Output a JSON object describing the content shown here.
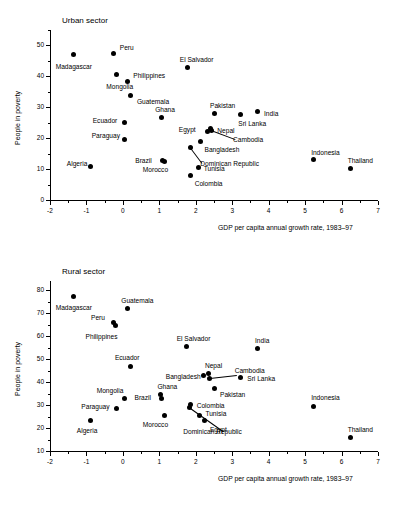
{
  "figure": {
    "shared_xlabel": "GDP per capita annual growth rate, 1983–97",
    "shared_ylabel": "People in poverty"
  },
  "chart_data": [
    {
      "type": "scatter",
      "title": "Urban sector",
      "xlabel": "GDP per capita annual growth rate, 1983–97",
      "ylabel": "People in poverty",
      "xlim": [
        -2,
        7
      ],
      "ylim": [
        0,
        55
      ],
      "xticks": [
        -2,
        -1,
        0,
        1,
        2,
        3,
        4,
        5,
        6,
        7
      ],
      "xticklabels": [
        "-2",
        "-1",
        "0",
        "1",
        "2",
        "3",
        "4",
        "5",
        "6",
        "7"
      ],
      "yticks": [
        0,
        10,
        20,
        30,
        40,
        50
      ],
      "yticklabels": [
        "0",
        "10",
        "20",
        "30",
        "40",
        "50"
      ],
      "minor_xtick_step": 0.5,
      "minor_ytick_step": 5,
      "grid": false,
      "legend": "none",
      "points": [
        {
          "name": "Madagascar",
          "x": -1.35,
          "y": 47.0,
          "label_dx": -18,
          "label_dy": 12,
          "leader": false
        },
        {
          "name": "Algeria",
          "x": -0.88,
          "y": 11.0,
          "label_dx": -24,
          "label_dy": -2,
          "leader": false
        },
        {
          "name": "Peru",
          "x": -0.25,
          "y": 47.5,
          "label_dx": 6,
          "label_dy": -5,
          "leader": false
        },
        {
          "name": "Mongolia",
          "x": -0.18,
          "y": 40.5,
          "label_dx": -10,
          "label_dy": 12,
          "leader": false
        },
        {
          "name": "Philippines",
          "x": 0.12,
          "y": 38.5,
          "label_dx": 6,
          "label_dy": -5,
          "leader": false
        },
        {
          "name": "Ecuador",
          "x": 0.05,
          "y": 25.0,
          "label_dx": -32,
          "label_dy": -2,
          "leader": false
        },
        {
          "name": "Paraguay",
          "x": 0.05,
          "y": 19.6,
          "label_dx": -33,
          "label_dy": -3,
          "leader": false
        },
        {
          "name": "Guatemala",
          "x": 0.22,
          "y": 33.8,
          "label_dx": 6,
          "label_dy": 6,
          "leader": false
        },
        {
          "name": "Ghana",
          "x": 1.05,
          "y": 26.7,
          "label_dx": -6,
          "label_dy": -7,
          "leader": false
        },
        {
          "name": "Brazil",
          "x": 1.08,
          "y": 12.8,
          "label_dx": -27,
          "label_dy": 1,
          "leader": false
        },
        {
          "name": "Morocco",
          "x": 1.15,
          "y": 12.5,
          "label_dx": -22,
          "label_dy": 9,
          "leader": false
        },
        {
          "name": "El Salvador",
          "x": 1.78,
          "y": 43.0,
          "label_dx": -8,
          "label_dy": -7,
          "leader": false
        },
        {
          "name": "Dominican Republic",
          "x": 1.85,
          "y": 17.0,
          "label_dx": 10,
          "label_dy": 17,
          "leader": true
        },
        {
          "name": "Colombia",
          "x": 1.86,
          "y": 8.0,
          "label_dx": 4,
          "label_dy": 9,
          "leader": false
        },
        {
          "name": "Tunisia",
          "x": 2.08,
          "y": 10.6,
          "label_dx": 5,
          "label_dy": 2,
          "leader": false
        },
        {
          "name": "Bangladesh",
          "x": 2.13,
          "y": 18.9,
          "label_dx": 4,
          "label_dy": 8,
          "leader": false
        },
        {
          "name": "Egypt",
          "x": 2.33,
          "y": 22.3,
          "label_dx": -29,
          "label_dy": -1,
          "leader": false
        },
        {
          "name": "Nepal",
          "x": 2.4,
          "y": 23.0,
          "label_dx": 7,
          "label_dy": 2,
          "leader": false
        },
        {
          "name": "Cambodia",
          "x": 2.42,
          "y": 22.6,
          "label_dx": 22,
          "label_dy": 10,
          "leader": true
        },
        {
          "name": "Pakistan",
          "x": 2.5,
          "y": 28.0,
          "label_dx": -4,
          "label_dy": -7,
          "leader": false
        },
        {
          "name": "Sri Lanka",
          "x": 3.22,
          "y": 27.7,
          "label_dx": -2,
          "label_dy": 10,
          "leader": false
        },
        {
          "name": "India",
          "x": 3.68,
          "y": 28.6,
          "label_dx": 7,
          "label_dy": 2,
          "leader": false
        },
        {
          "name": "Indonesia",
          "x": 5.22,
          "y": 13.0,
          "label_dx": -2,
          "label_dy": -7,
          "leader": false
        },
        {
          "name": "Thailand",
          "x": 6.25,
          "y": 10.2,
          "label_dx": -3,
          "label_dy": -7,
          "leader": false
        }
      ]
    },
    {
      "type": "scatter",
      "title": "Rural sector",
      "xlabel": "GDP per capita annual growth rate, 1983–97",
      "ylabel": "People in poverty",
      "xlim": [
        -2,
        7
      ],
      "ylim": [
        10,
        84
      ],
      "xticks": [
        -2,
        -1,
        0,
        1,
        2,
        3,
        4,
        5,
        6,
        7
      ],
      "xticklabels": [
        "-2",
        "-1",
        "0",
        "1",
        "2",
        "3",
        "4",
        "5",
        "6",
        "7"
      ],
      "yticks": [
        10,
        20,
        30,
        40,
        50,
        60,
        70,
        80
      ],
      "yticklabels": [
        "10",
        "20",
        "30",
        "40",
        "50",
        "60",
        "70",
        "80"
      ],
      "minor_xtick_step": 0.5,
      "minor_ytick_step": 5,
      "grid": false,
      "legend": "none",
      "points": [
        {
          "name": "Madagascar",
          "x": -1.35,
          "y": 77.2,
          "label_dx": -18,
          "label_dy": 11,
          "leader": false
        },
        {
          "name": "Algeria",
          "x": -0.88,
          "y": 23.4,
          "label_dx": -14,
          "label_dy": 11,
          "leader": false
        },
        {
          "name": "Peru",
          "x": -0.27,
          "y": 66.0,
          "label_dx": -22,
          "label_dy": -4,
          "leader": false
        },
        {
          "name": "Philippines",
          "x": -0.2,
          "y": 64.6,
          "label_dx": -30,
          "label_dy": 11,
          "leader": false
        },
        {
          "name": "Paraguay",
          "x": -0.18,
          "y": 28.5,
          "label_dx": -35,
          "label_dy": -2,
          "leader": false
        },
        {
          "name": "Mongolia",
          "x": 0.05,
          "y": 33.0,
          "label_dx": -28,
          "label_dy": -7,
          "leader": false
        },
        {
          "name": "Guatemala",
          "x": 0.12,
          "y": 72.0,
          "label_dx": -6,
          "label_dy": -8,
          "leader": false
        },
        {
          "name": "Ecuador",
          "x": 0.22,
          "y": 47.0,
          "label_dx": -16,
          "label_dy": -8,
          "leader": false
        },
        {
          "name": "Ghana",
          "x": 1.03,
          "y": 34.5,
          "label_dx": -3,
          "label_dy": -8,
          "leader": false
        },
        {
          "name": "Brazil",
          "x": 1.06,
          "y": 32.7,
          "label_dx": -27,
          "label_dy": -1,
          "leader": false
        },
        {
          "name": "Morocco",
          "x": 1.15,
          "y": 25.3,
          "label_dx": -22,
          "label_dy": 9,
          "leader": false
        },
        {
          "name": "El Salvador",
          "x": 1.75,
          "y": 55.7,
          "label_dx": -10,
          "label_dy": -7,
          "leader": false
        },
        {
          "name": "Dominican Republic",
          "x": 1.82,
          "y": 29.0,
          "label_dx": -6,
          "label_dy": 25,
          "leader": true
        },
        {
          "name": "Colombia",
          "x": 1.86,
          "y": 30.2,
          "label_dx": 6,
          "label_dy": 1,
          "leader": false
        },
        {
          "name": "Tunisia",
          "x": 2.1,
          "y": 25.6,
          "label_dx": 6,
          "label_dy": -1,
          "leader": false
        },
        {
          "name": "Bangladesh",
          "x": 2.22,
          "y": 42.9,
          "label_dx": -38,
          "label_dy": 2,
          "leader": false
        },
        {
          "name": "Egypt",
          "x": 2.25,
          "y": 23.4,
          "label_dx": 5,
          "label_dy": 10,
          "leader": false
        },
        {
          "name": "Nepal",
          "x": 2.36,
          "y": 43.9,
          "label_dx": -4,
          "label_dy": -7,
          "leader": false
        },
        {
          "name": "Cambodia",
          "x": 2.38,
          "y": 41.6,
          "label_dx": 25,
          "label_dy": -7,
          "leader": true
        },
        {
          "name": "Pakistan",
          "x": 2.5,
          "y": 37.0,
          "label_dx": 6,
          "label_dy": 6,
          "leader": false
        },
        {
          "name": "Sri Lanka",
          "x": 3.22,
          "y": 42.0,
          "label_dx": 7,
          "label_dy": 2,
          "leader": false
        },
        {
          "name": "India",
          "x": 3.68,
          "y": 54.6,
          "label_dx": -2,
          "label_dy": -8,
          "leader": false
        },
        {
          "name": "Indonesia",
          "x": 5.22,
          "y": 29.4,
          "label_dx": -2,
          "label_dy": -8,
          "leader": false
        },
        {
          "name": "Thailand",
          "x": 6.25,
          "y": 15.7,
          "label_dx": -3,
          "label_dy": -8,
          "leader": false
        }
      ]
    }
  ]
}
